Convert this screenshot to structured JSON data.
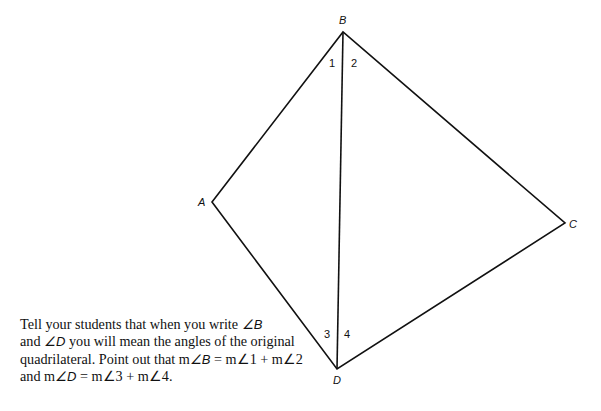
{
  "figure": {
    "type": "quadrilateral-with-diagonal",
    "vertices": {
      "A": {
        "label": "A",
        "x": 212,
        "y": 202
      },
      "B": {
        "label": "B",
        "x": 343,
        "y": 32
      },
      "C": {
        "label": "C",
        "x": 565,
        "y": 223
      },
      "D": {
        "label": "D",
        "x": 337,
        "y": 369
      }
    },
    "diagonal": [
      "B",
      "D"
    ],
    "angle_labels": {
      "a1": "1",
      "a2": "2",
      "a3": "3",
      "a4": "4"
    },
    "stroke_color": "#111111"
  },
  "caption": {
    "line1_text": "Tell your students that when you write ",
    "line1_sym": "∠B",
    "line2_pre": "and ",
    "line2_sym": "∠D",
    "line2_text": " you will mean the angles of the original",
    "line3_text": "quadrilateral. Point out that m",
    "line3_sym": "∠B",
    "line3_rest": " = m∠1 + m∠2",
    "line4_pre": "and m",
    "line4_sym": "∠D",
    "line4_rest": " = m∠3 + m∠4."
  }
}
